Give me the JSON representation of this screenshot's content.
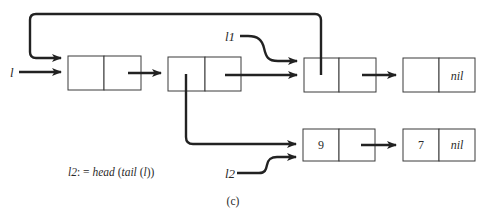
{
  "diagram": {
    "type": "linked-list-pointer-diagram",
    "colors": {
      "background": "#ffffff",
      "line": "#222222",
      "box_stroke": "#3a3a3a",
      "text": "#2a2a2a"
    },
    "variables": {
      "l": "l",
      "l1": "l1",
      "l2": "l2"
    },
    "nodes": [
      {
        "id": "n1",
        "head": "",
        "tail": ""
      },
      {
        "id": "n2",
        "head": "",
        "tail": ""
      },
      {
        "id": "n3",
        "head": "",
        "tail": ""
      },
      {
        "id": "n4",
        "head": "",
        "tail": "nil"
      },
      {
        "id": "n5",
        "head": "9",
        "tail": ""
      },
      {
        "id": "n6",
        "head": "7",
        "tail": "nil"
      }
    ],
    "edges": [
      {
        "from": "l",
        "to": "n1"
      },
      {
        "from": "n1.tail",
        "to": "n2"
      },
      {
        "from": "n2.tail",
        "to": "n3"
      },
      {
        "from": "n3.tail",
        "to": "n4"
      },
      {
        "from": "n3.head",
        "to": "n1"
      },
      {
        "from": "l1",
        "to": "n3"
      },
      {
        "from": "n2.head",
        "to": "n5"
      },
      {
        "from": "l2",
        "to": "n5"
      },
      {
        "from": "n5.tail",
        "to": "n6"
      }
    ],
    "statement": {
      "lhs": "l2",
      "assign": ": =",
      "rhs_fn1": "head",
      "rhs_fn2": "tail",
      "rhs_arg": "l"
    },
    "caption": "(c)"
  }
}
